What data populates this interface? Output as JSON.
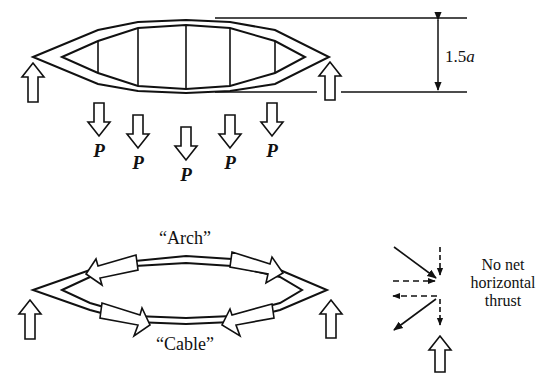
{
  "figure": {
    "top": {
      "title": "lenticular truss under load",
      "dimension_label_prefix": "1.5",
      "dimension_label_var": "a",
      "load_label": "P",
      "loads": [
        {
          "label": "P",
          "x": 99,
          "top": 103,
          "label_y": 142
        },
        {
          "label": "P",
          "x": 138,
          "top": 115,
          "label_y": 155
        },
        {
          "label": "P",
          "x": 186,
          "top": 127,
          "label_y": 166
        },
        {
          "label": "P",
          "x": 230,
          "top": 115,
          "label_y": 155
        },
        {
          "label": "P",
          "x": 272,
          "top": 103,
          "label_y": 142
        }
      ],
      "supports": [
        "left",
        "right"
      ]
    },
    "bottom": {
      "arch_label": "“Arch”",
      "cable_label": "“Cable”",
      "arch_arrows": [
        "compression-left",
        "compression-right"
      ],
      "cable_arrows": [
        "tension-left",
        "tension-right"
      ]
    },
    "force_diagram": {
      "note_line1": "No net",
      "note_line2": "horizontal",
      "note_line3": "thrust"
    },
    "colors": {
      "stroke": "#111111",
      "background": "#ffffff"
    }
  }
}
